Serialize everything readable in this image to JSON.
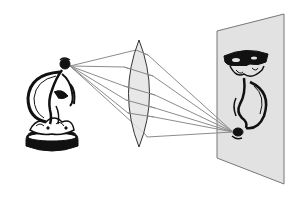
{
  "diagram": {
    "colors": {
      "background": "#ffffff",
      "lens_fill": "#e4e4e4",
      "lens_stroke": "#333333",
      "ray": "#8c8c8c",
      "screen_fill": "#e2e2e2",
      "screen_stroke": "#777777",
      "ink": "#111111"
    },
    "object": {
      "label": "statuette (object)",
      "source_point": [
        70,
        66
      ],
      "bbox": [
        25,
        58,
        78,
        155
      ]
    },
    "lens": {
      "label": "biconvex lens",
      "top": [
        139,
        40
      ],
      "bottom": [
        139,
        147
      ],
      "left_x": 124,
      "right_x": 155
    },
    "rays": [
      {
        "from": [
          70,
          66
        ],
        "lens_in": [
          136,
          50
        ],
        "lens_out": [
          148,
          55
        ],
        "to": [
          233,
          132
        ]
      },
      {
        "from": [
          70,
          66
        ],
        "lens_in": [
          124,
          67
        ],
        "lens_out": [
          153,
          76
        ],
        "to": [
          233,
          132
        ]
      },
      {
        "from": [
          70,
          66
        ],
        "lens_in": [
          124,
          86
        ],
        "lens_out": [
          155,
          95
        ],
        "to": [
          233,
          132
        ]
      },
      {
        "from": [
          70,
          66
        ],
        "lens_in": [
          126,
          100
        ],
        "lens_out": [
          155,
          108
        ],
        "to": [
          233,
          132
        ]
      },
      {
        "from": [
          70,
          66
        ],
        "lens_in": [
          128,
          113
        ],
        "lens_out": [
          154,
          117
        ],
        "to": [
          233,
          132
        ]
      },
      {
        "from": [
          70,
          66
        ],
        "lens_in": [
          145,
          134
        ],
        "lens_out": [
          147,
          137
        ],
        "to": [
          233,
          132
        ]
      }
    ],
    "screen": {
      "label": "projection screen",
      "corners": [
        [
          217,
          31
        ],
        [
          284,
          14
        ],
        [
          284,
          184
        ],
        [
          217,
          158
        ]
      ]
    },
    "image": {
      "label": "inverted image of statuette",
      "focus_point": [
        233,
        132
      ],
      "bbox": [
        225,
        48,
        268,
        138
      ]
    }
  }
}
